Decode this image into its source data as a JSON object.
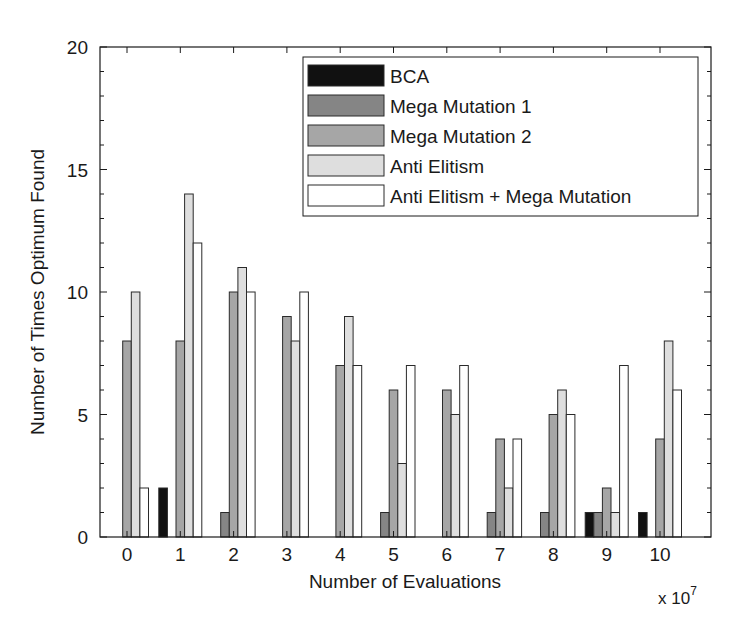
{
  "chart_data": {
    "type": "bar",
    "title": "",
    "xlabel": "Number of Evaluations",
    "ylabel": "Number of Times Optimum Found",
    "x_multiplier_label": "x 10",
    "x_multiplier_exponent": "7",
    "categories": [
      "0",
      "1",
      "2",
      "3",
      "4",
      "5",
      "6",
      "7",
      "8",
      "9",
      "10"
    ],
    "series": [
      {
        "name": "BCA",
        "color": "#111111",
        "values": [
          0,
          2,
          0,
          0,
          0,
          0,
          0,
          0,
          0,
          1,
          1
        ]
      },
      {
        "name": "Mega Mutation 1",
        "color": "#858585",
        "values": [
          0,
          0,
          1,
          0,
          0,
          1,
          0,
          1,
          1,
          1,
          0
        ]
      },
      {
        "name": "Mega Mutation 2",
        "color": "#a6a6a6",
        "values": [
          8,
          8,
          10,
          9,
          7,
          6,
          6,
          4,
          5,
          2,
          4
        ]
      },
      {
        "name": "Anti Elitism",
        "color": "#dedede",
        "values": [
          10,
          14,
          11,
          8,
          9,
          3,
          5,
          2,
          6,
          1,
          8
        ]
      },
      {
        "name": "Anti Elitism + Mega Mutation",
        "color": "#ffffff",
        "values": [
          2,
          12,
          10,
          10,
          7,
          7,
          7,
          4,
          5,
          7,
          6
        ]
      }
    ],
    "ylim": [
      0,
      20
    ],
    "yticks": [
      "0",
      "5",
      "10",
      "15",
      "20"
    ],
    "grid": false,
    "legend_position": "upper right"
  }
}
